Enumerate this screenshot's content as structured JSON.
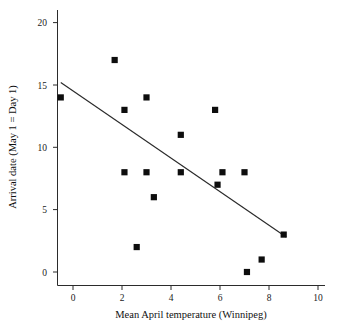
{
  "chart_data": {
    "type": "scatter",
    "title": "",
    "xlabel": "Mean April temperature (Winnipeg)",
    "ylabel": "Arrival date (May 1 = Day 1)",
    "xlim": [
      -1.0,
      10.4
    ],
    "ylim": [
      -1.0,
      20.6
    ],
    "xticks": [
      0,
      2,
      4,
      6,
      8,
      10
    ],
    "xtick_labels": [
      "0",
      "2",
      "4",
      "6",
      "8",
      "10"
    ],
    "yticks": [
      0,
      5,
      10,
      15,
      20
    ],
    "ytick_labels": [
      "0",
      "5",
      "10",
      "15",
      "20"
    ],
    "grid": false,
    "legend": null,
    "marker": "square",
    "marker_color": "#0d0d0d",
    "points": [
      {
        "x": -0.5,
        "y": 14
      },
      {
        "x": 1.7,
        "y": 17
      },
      {
        "x": 2.1,
        "y": 13
      },
      {
        "x": 2.1,
        "y": 8
      },
      {
        "x": 2.6,
        "y": 2
      },
      {
        "x": 3.0,
        "y": 14
      },
      {
        "x": 3.0,
        "y": 8
      },
      {
        "x": 3.3,
        "y": 6
      },
      {
        "x": 4.4,
        "y": 11
      },
      {
        "x": 4.4,
        "y": 8
      },
      {
        "x": 5.8,
        "y": 13
      },
      {
        "x": 5.9,
        "y": 7
      },
      {
        "x": 6.1,
        "y": 8
      },
      {
        "x": 7.0,
        "y": 8
      },
      {
        "x": 7.1,
        "y": 0
      },
      {
        "x": 7.7,
        "y": 1
      },
      {
        "x": 8.6,
        "y": 3
      }
    ],
    "trendline": {
      "name": "linear regression",
      "color": "#2a2a2a",
      "x_start": -0.5,
      "y_start": 15.2,
      "x_end": 8.7,
      "y_end": 2.8
    }
  }
}
